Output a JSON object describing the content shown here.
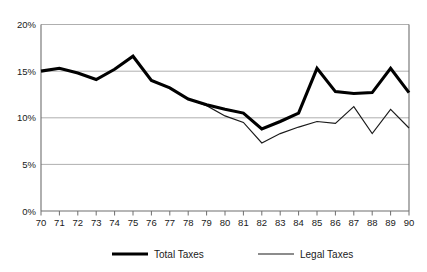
{
  "chart_data": {
    "type": "line",
    "title": "",
    "subtitle": "",
    "xlabel": "",
    "ylabel": "",
    "x": [
      "70",
      "71",
      "72",
      "73",
      "74",
      "75",
      "76",
      "77",
      "78",
      "79",
      "80",
      "81",
      "82",
      "83",
      "84",
      "85",
      "86",
      "87",
      "88",
      "89",
      "90"
    ],
    "categories": [
      "70",
      "71",
      "72",
      "73",
      "74",
      "75",
      "76",
      "77",
      "78",
      "79",
      "80",
      "81",
      "82",
      "83",
      "84",
      "85",
      "86",
      "87",
      "88",
      "89",
      "90"
    ],
    "series": [
      {
        "name": "Total Taxes",
        "style": "thick",
        "color": "#000000",
        "values": [
          15.0,
          15.3,
          14.8,
          14.1,
          15.2,
          16.6,
          14.0,
          13.2,
          12.0,
          11.4,
          10.9,
          10.5,
          8.8,
          9.6,
          10.5,
          15.3,
          12.8,
          12.6,
          12.7,
          15.3,
          12.7
        ]
      },
      {
        "name": "Legal Taxes",
        "style": "thin",
        "color": "#1a1a1a",
        "values": [
          15.0,
          15.3,
          14.8,
          14.1,
          15.2,
          16.6,
          14.0,
          13.2,
          12.0,
          11.3,
          10.2,
          9.5,
          7.3,
          8.3,
          9.0,
          9.6,
          9.4,
          11.2,
          8.3,
          10.9,
          8.9
        ]
      }
    ],
    "ylim": [
      0,
      20
    ],
    "yticks": [
      0,
      5,
      10,
      15,
      20
    ],
    "ytick_labels": [
      "0%",
      "5%",
      "10%",
      "15%",
      "20%"
    ],
    "grid": true,
    "grid_axis": "y",
    "legend_position": "bottom",
    "legend": [
      {
        "label": "Total Taxes",
        "style": "thick"
      },
      {
        "label": "Legal Taxes",
        "style": "thin"
      }
    ]
  },
  "axis": {
    "y_tick_labels": [
      "20%",
      "15%",
      "10%",
      "5%",
      "0%"
    ],
    "x_tick_labels": [
      "70",
      "71",
      "72",
      "73",
      "74",
      "75",
      "76",
      "77",
      "78",
      "79",
      "80",
      "81",
      "82",
      "83",
      "84",
      "85",
      "86",
      "87",
      "88",
      "89",
      "90"
    ]
  },
  "legend": {
    "items": [
      {
        "label": "Total Taxes"
      },
      {
        "label": "Legal Taxes"
      }
    ]
  },
  "colors": {
    "total_taxes": "#000000",
    "legal_taxes": "#1a1a1a",
    "gridline": "#9a9a9a",
    "axis": "#6e6e6e",
    "background": "#ffffff"
  }
}
